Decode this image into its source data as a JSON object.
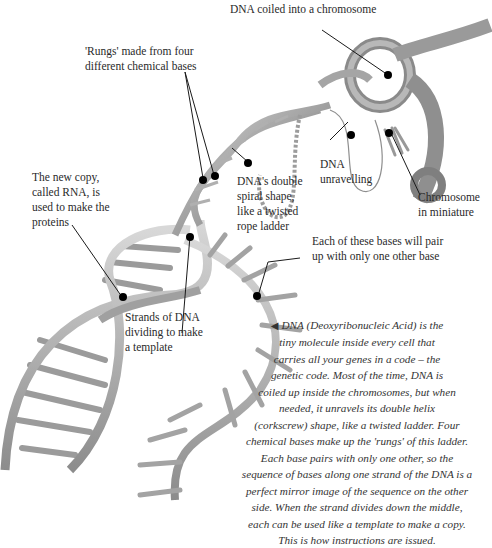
{
  "diagram": {
    "labels": {
      "chromosome_coil": "DNA coiled into a chromosome",
      "rungs": "'Rungs' made from four\ndifferent chemical bases",
      "rna_copy": "The new copy,\ncalled RNA, is\nused to make the\nproteins",
      "double_spiral": "DNA's double\nspiral shape,\nlike a twisted\nrope ladder",
      "unravelling": "DNA\nunravelling",
      "chromosome_miniature": "Chromosome\nin miniature",
      "base_pairs": "Each of these bases will pair\nup with only one other base",
      "strands_dividing": "Strands of DNA\ndividing to make\na template"
    },
    "caption": {
      "arrow": "◀",
      "text": "DNA (Deoxyribonucleic Acid) is the\ntiny molecule inside every cell that\ncarries all your genes in a  code – the\ngenetic code. Most of the time, DNA is\ncoiled up inside the chromosomes, but when\nneeded, it unravels its double helix\n(corkscrew) shape, like a twisted ladder. Four\nchemical bases make up the 'rungs' of this ladder.\nEach base pairs with only one other, so the\nsequence of bases along one strand of the DNA is a\nperfect mirror image of the sequence on the other\nside. When the strand divides down the middle,\neach can be used like a template to make a copy.\nThis is how instructions are issued."
    },
    "colors": {
      "strand": "#b8b8b8",
      "strand_dark": "#8a8a8a",
      "rung": "#a9a9a9",
      "marker": "#000000",
      "text": "#2a2a2a"
    }
  }
}
